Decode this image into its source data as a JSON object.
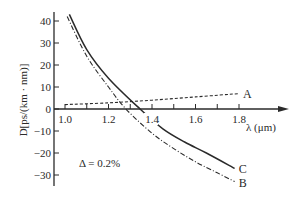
{
  "chart_data": {
    "type": "line",
    "title": "",
    "xlabel": "λ (μm)",
    "ylabel": "D[ps/(km · nm)]",
    "xlim": [
      0.95,
      2.0
    ],
    "ylim": [
      -35,
      45
    ],
    "x_ticks": [
      1.0,
      1.1,
      1.2,
      1.3,
      1.4,
      1.5,
      1.6,
      1.7,
      1.8
    ],
    "x_tick_labels": [
      "1.0",
      "",
      "1.2",
      "",
      "1.4",
      "",
      "1.6",
      "",
      "1.8"
    ],
    "y_ticks": [
      40,
      30,
      20,
      10,
      0,
      -10,
      -20,
      -30
    ],
    "y_tick_labels": [
      "40",
      "30",
      "20",
      "10",
      "0",
      "-10",
      "-20",
      "-30"
    ],
    "grid": false,
    "annotation": "Δ = 0.2%",
    "series": [
      {
        "name": "A",
        "style": "dashed",
        "x": [
          1.0,
          1.2,
          1.4,
          1.6,
          1.8
        ],
        "y": [
          2.0,
          2.8,
          4.0,
          5.5,
          7.0
        ]
      },
      {
        "name": "B",
        "style": "dashdot",
        "x": [
          1.01,
          1.1,
          1.2,
          1.28,
          1.4,
          1.5,
          1.6,
          1.7,
          1.78
        ],
        "y": [
          42,
          24,
          10,
          0,
          -11,
          -18,
          -24,
          -29,
          -33
        ]
      },
      {
        "name": "C",
        "style": "solid",
        "x": [
          1.02,
          1.1,
          1.2,
          1.345,
          1.45,
          1.55,
          1.65,
          1.78
        ],
        "y": [
          43,
          27,
          14,
          0,
          -9,
          -15,
          -20,
          -27
        ]
      }
    ]
  }
}
